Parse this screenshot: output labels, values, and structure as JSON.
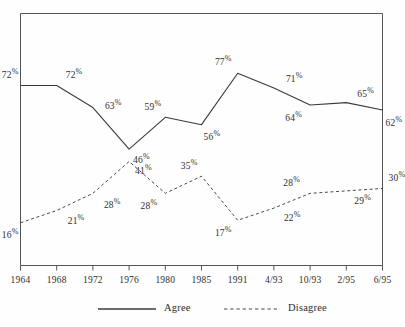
{
  "chart_data": {
    "type": "line",
    "title": "",
    "subtitle": "",
    "xlabel": "",
    "ylabel": "",
    "categories": [
      "1964",
      "1968",
      "1972",
      "1976",
      "1980",
      "1985",
      "1991",
      "4/93",
      "10/93",
      "2/95",
      "6/95"
    ],
    "ylim": [
      0,
      100
    ],
    "grid": false,
    "legend_position": "bottom",
    "value_suffix": "%",
    "series": [
      {
        "name": "Agree",
        "style": "solid",
        "color": "#3a3a3a",
        "values": [
          72,
          72,
          63,
          46,
          59,
          56,
          77,
          71,
          64,
          65,
          62
        ],
        "labels": [
          "72%",
          "72%",
          "63%",
          "46%",
          "59%",
          "56%",
          "77%",
          "71%",
          "64%",
          "65%",
          "62%"
        ]
      },
      {
        "name": "Disagree",
        "style": "dashed",
        "color": "#4a4a4a",
        "values": [
          16,
          21,
          28,
          41,
          28,
          35,
          17,
          22,
          28,
          29,
          30
        ],
        "labels": [
          "16%",
          "21%",
          "28%",
          "41%",
          "28%",
          "35%",
          "17%",
          "22%",
          "28%",
          "29%",
          "30%"
        ]
      }
    ]
  },
  "legend": {
    "items": [
      {
        "label": "Agree",
        "style": "solid"
      },
      {
        "label": "Disagree",
        "style": "dashed"
      }
    ]
  },
  "axis": {
    "tick_labels": [
      "1964",
      "1968",
      "1972",
      "1976",
      "1980",
      "1985",
      "1991",
      "4/93",
      "10/93",
      "2/95",
      "6/95"
    ]
  },
  "colors": {
    "frame": "#555555",
    "agree_line": "#3a3a3a",
    "disagree_line": "#4a4a4a",
    "text": "#2e2e2e",
    "background": "#fefefe"
  }
}
